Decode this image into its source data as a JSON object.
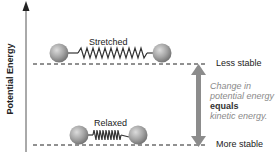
{
  "axis": {
    "label": "Potential Energy"
  },
  "states": {
    "stretched": {
      "label": "Stretched",
      "stability": "Less stable"
    },
    "relaxed": {
      "label": "Relaxed",
      "stability": "More stable"
    }
  },
  "note": {
    "line1": "Change in",
    "line2": "potential energy",
    "line3": "equals",
    "line4": "kinetic energy."
  },
  "colors": {
    "ball": "#9a9a9a",
    "ball_highlight": "#d8d8d8",
    "spring": "#333333",
    "arrow": "#8c8c8c",
    "note_text": "#8a8a8a"
  }
}
